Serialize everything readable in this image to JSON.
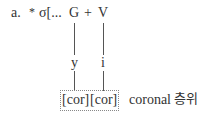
{
  "diagram": {
    "label": "a.",
    "star": "*",
    "syllable": "σ[...",
    "glide": "G",
    "plus": "+",
    "vowel": "V",
    "glide_segment": "y",
    "vowel_segment": "i",
    "feature_1": "[cor]",
    "feature_2": "[cor]",
    "tier_label": "coronal",
    "tier_label_korean": "층위"
  }
}
